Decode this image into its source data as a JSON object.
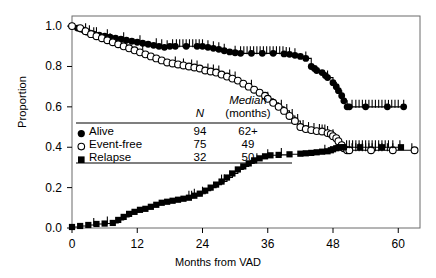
{
  "chart_data": {
    "type": "line",
    "title": "",
    "xlabel": "Months from VAD",
    "ylabel": "Proportion",
    "xlim": [
      0,
      64
    ],
    "ylim": [
      0,
      1.05
    ],
    "xticks": [
      0,
      12,
      24,
      36,
      48,
      60
    ],
    "yticks": [
      "0.0",
      "0.2",
      "0.4",
      "0.6",
      "0.8",
      "1.0"
    ],
    "ytick_values": [
      0,
      0.2,
      0.4,
      0.6,
      0.8,
      1.0
    ],
    "grid": false,
    "legend_position": "center-left",
    "series": [
      {
        "name": "Alive",
        "marker": "filled-circle",
        "n": 94,
        "median": "62+",
        "points": [
          [
            0,
            1.0
          ],
          [
            1,
            0.99
          ],
          [
            1.6,
            0.985
          ],
          [
            2.2,
            0.98
          ],
          [
            2.8,
            0.97
          ],
          [
            3.4,
            0.965
          ],
          [
            4,
            0.96
          ],
          [
            5,
            0.955
          ],
          [
            6,
            0.95
          ],
          [
            7,
            0.945
          ],
          [
            8,
            0.94
          ],
          [
            9,
            0.935
          ],
          [
            10,
            0.93
          ],
          [
            11,
            0.925
          ],
          [
            12,
            0.92
          ],
          [
            13,
            0.915
          ],
          [
            14,
            0.91
          ],
          [
            15,
            0.905
          ],
          [
            16,
            0.9
          ],
          [
            17,
            0.895
          ],
          [
            18,
            0.9
          ],
          [
            19,
            0.9
          ],
          [
            21,
            0.9
          ],
          [
            23,
            0.9
          ],
          [
            24,
            0.9
          ],
          [
            25,
            0.895
          ],
          [
            26,
            0.89
          ],
          [
            27,
            0.885
          ],
          [
            28,
            0.878
          ],
          [
            29,
            0.872
          ],
          [
            30,
            0.868
          ],
          [
            31,
            0.865
          ],
          [
            33,
            0.865
          ],
          [
            35,
            0.865
          ],
          [
            37,
            0.865
          ],
          [
            39,
            0.862
          ],
          [
            40,
            0.86
          ],
          [
            41,
            0.855
          ],
          [
            42,
            0.85
          ],
          [
            43,
            0.84
          ],
          [
            44,
            0.8
          ],
          [
            44.6,
            0.79
          ],
          [
            45,
            0.78
          ],
          [
            46,
            0.77
          ],
          [
            46.6,
            0.755
          ],
          [
            47,
            0.745
          ],
          [
            48,
            0.72
          ],
          [
            48.6,
            0.7
          ],
          [
            49,
            0.68
          ],
          [
            49.6,
            0.655
          ],
          [
            50,
            0.63
          ],
          [
            50.6,
            0.6
          ],
          [
            51,
            0.6
          ],
          [
            54,
            0.6
          ],
          [
            58,
            0.6
          ],
          [
            61,
            0.6
          ]
        ],
        "censor_times": [
          2.5,
          3.2,
          4.5,
          6.5,
          9.5,
          12.5,
          15.5,
          16.5,
          17.5,
          18.5,
          19.2,
          19.8,
          20.4,
          21,
          21.6,
          22.2,
          22.8,
          23.4,
          24,
          25,
          26,
          27,
          28,
          30,
          31,
          31.6,
          32.2,
          32.8,
          33.4,
          34,
          34.6,
          35.2,
          35.8,
          36.4,
          37,
          37.6,
          38.2,
          38.8,
          39.4,
          40,
          41,
          43,
          47,
          51.5,
          52.2,
          52.8,
          53.4,
          54,
          54.6,
          55.2,
          55.8,
          56.4,
          57,
          57.6,
          58.2,
          58.8,
          59.4,
          60,
          61
        ]
      },
      {
        "name": "Event-free",
        "marker": "open-circle",
        "n": 75,
        "median": 49,
        "points": [
          [
            0,
            1.0
          ],
          [
            1.5,
            0.99
          ],
          [
            2.5,
            0.975
          ],
          [
            3.5,
            0.96
          ],
          [
            4.5,
            0.95
          ],
          [
            5.5,
            0.94
          ],
          [
            6.5,
            0.93
          ],
          [
            7.5,
            0.92
          ],
          [
            8.5,
            0.91
          ],
          [
            9.5,
            0.9
          ],
          [
            10.5,
            0.89
          ],
          [
            11.5,
            0.88
          ],
          [
            12.5,
            0.87
          ],
          [
            13.5,
            0.86
          ],
          [
            14.5,
            0.85
          ],
          [
            15.5,
            0.84
          ],
          [
            16.5,
            0.83
          ],
          [
            17.5,
            0.82
          ],
          [
            18.5,
            0.815
          ],
          [
            19.5,
            0.81
          ],
          [
            20.5,
            0.805
          ],
          [
            21.5,
            0.8
          ],
          [
            22.5,
            0.795
          ],
          [
            23.5,
            0.79
          ],
          [
            24.5,
            0.78
          ],
          [
            25.5,
            0.775
          ],
          [
            26.5,
            0.77
          ],
          [
            27.5,
            0.76
          ],
          [
            28.5,
            0.75
          ],
          [
            29.5,
            0.74
          ],
          [
            30.5,
            0.73
          ],
          [
            31.5,
            0.715
          ],
          [
            32.5,
            0.7
          ],
          [
            33.5,
            0.685
          ],
          [
            34.5,
            0.67
          ],
          [
            35.5,
            0.655
          ],
          [
            36,
            0.64
          ],
          [
            37,
            0.62
          ],
          [
            38,
            0.6
          ],
          [
            39,
            0.58
          ],
          [
            40,
            0.555
          ],
          [
            41,
            0.53
          ],
          [
            42,
            0.5
          ],
          [
            43,
            0.49
          ],
          [
            44,
            0.485
          ],
          [
            45,
            0.48
          ],
          [
            46,
            0.478
          ],
          [
            47,
            0.47
          ],
          [
            47.6,
            0.465
          ],
          [
            48,
            0.455
          ],
          [
            48.6,
            0.445
          ],
          [
            49,
            0.43
          ],
          [
            49.6,
            0.41
          ],
          [
            50,
            0.395
          ],
          [
            50.6,
            0.385
          ],
          [
            51,
            0.385
          ],
          [
            55,
            0.385
          ],
          [
            59,
            0.385
          ],
          [
            63,
            0.385
          ]
        ],
        "censor_times": [
          4,
          7,
          13,
          19,
          20.5,
          22,
          23,
          25,
          26,
          27,
          29,
          30,
          33,
          36,
          38.5,
          39.5,
          40.5,
          41.5,
          42.5,
          43.5,
          44.5,
          45.5,
          46,
          46.5,
          47,
          48,
          51.5,
          52.2,
          52.8,
          53.4,
          54,
          54.6,
          55.2,
          55.8,
          56.4,
          57,
          58,
          59,
          62.5
        ]
      },
      {
        "name": "Relapse",
        "marker": "filled-square",
        "n": 32,
        "median": 50,
        "points": [
          [
            0,
            0.005
          ],
          [
            1.5,
            0.01
          ],
          [
            3,
            0.015
          ],
          [
            4.5,
            0.02
          ],
          [
            6,
            0.022
          ],
          [
            7.5,
            0.025
          ],
          [
            8.5,
            0.04
          ],
          [
            9.5,
            0.055
          ],
          [
            10.5,
            0.07
          ],
          [
            11.5,
            0.08
          ],
          [
            12.5,
            0.09
          ],
          [
            13.5,
            0.095
          ],
          [
            14.5,
            0.105
          ],
          [
            15.5,
            0.115
          ],
          [
            16.5,
            0.125
          ],
          [
            17.5,
            0.13
          ],
          [
            18.5,
            0.135
          ],
          [
            19.5,
            0.14
          ],
          [
            20.5,
            0.145
          ],
          [
            21.5,
            0.15
          ],
          [
            22.5,
            0.16
          ],
          [
            23.5,
            0.17
          ],
          [
            24.5,
            0.185
          ],
          [
            25.5,
            0.2
          ],
          [
            26.5,
            0.215
          ],
          [
            27.5,
            0.23
          ],
          [
            28.5,
            0.25
          ],
          [
            29.5,
            0.27
          ],
          [
            30.5,
            0.29
          ],
          [
            31.5,
            0.305
          ],
          [
            32.5,
            0.32
          ],
          [
            33.5,
            0.335
          ],
          [
            34.5,
            0.345
          ],
          [
            35.5,
            0.355
          ],
          [
            36.5,
            0.36
          ],
          [
            38,
            0.362
          ],
          [
            40,
            0.365
          ],
          [
            42,
            0.368
          ],
          [
            43,
            0.37
          ],
          [
            44,
            0.372
          ],
          [
            45,
            0.375
          ],
          [
            46,
            0.378
          ],
          [
            47,
            0.38
          ],
          [
            47.6,
            0.385
          ],
          [
            48,
            0.39
          ],
          [
            48.6,
            0.395
          ],
          [
            49,
            0.398
          ],
          [
            49.6,
            0.4
          ],
          [
            50,
            0.4
          ],
          [
            53,
            0.4
          ],
          [
            57,
            0.4
          ],
          [
            60.5,
            0.4
          ]
        ],
        "censor_times": [
          4,
          6.5,
          21.5,
          22,
          22.5,
          24,
          27.5,
          28,
          29,
          34,
          36,
          38.5,
          46.5,
          50.5,
          51,
          51.6,
          52.2,
          52.8,
          53.4,
          54,
          54.6,
          55.2,
          55.8,
          56.4,
          57,
          57.6,
          58.2,
          59,
          60.3
        ]
      }
    ]
  },
  "legend": {
    "header_n": "N",
    "header_median_line1": "Median",
    "header_median_line2": "(months)",
    "rows": [
      {
        "label": "Alive",
        "n": "94",
        "median": "62+",
        "marker": "filled-circle"
      },
      {
        "label": "Event-free",
        "n": "75",
        "median": "49",
        "marker": "open-circle"
      },
      {
        "label": "Relapse",
        "n": "32",
        "median": "50",
        "marker": "filled-square"
      }
    ]
  },
  "colors": {
    "ink": "#000000",
    "background": "#ffffff"
  }
}
